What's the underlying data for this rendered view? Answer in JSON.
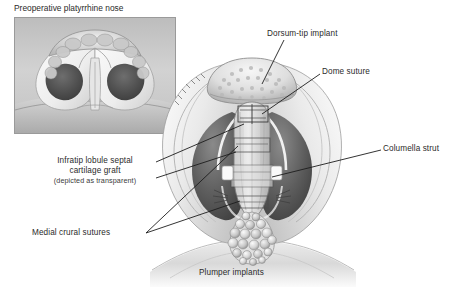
{
  "figure": {
    "kind": "medical-illustration",
    "background_color": "#ffffff",
    "ink_color": "#2b2b2b"
  },
  "inset": {
    "title": "Preoperative platyrrhine nose",
    "frame_color": "#9a9a9a"
  },
  "labels": {
    "infratip": {
      "line1": "Infratip lobule septal",
      "line2": "cartilage graft",
      "note": "(depicted as transparent)"
    },
    "medial_crural_sutures": "Medial crural sutures",
    "dorsum_tip_implant": "Dorsum-tip implant",
    "dome_suture": "Dome suture",
    "columella_strut": "Columella strut",
    "plumper_implants": "Plumper implants"
  }
}
